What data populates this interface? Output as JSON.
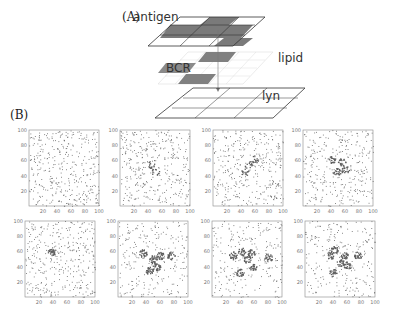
{
  "figure": {
    "part_a_label": "(A)",
    "part_b_label": "(B)",
    "layers": {
      "antigen": "antigen",
      "bcr": "BCR",
      "lipid": "lipid",
      "lyn": "lyn"
    },
    "colors": {
      "dark_cell": "#7a7a7a",
      "grid_line": "#444444",
      "lipid_grid": "#cccccc",
      "dot": "#6f6f6f",
      "frame": "#888888"
    }
  },
  "chart_data": [
    {
      "type": "scatter",
      "panel": 1,
      "row": 1,
      "xlim": [
        0,
        100
      ],
      "ylim": [
        0,
        100
      ],
      "x_ticks": [
        "20",
        "40",
        "60",
        "80",
        "100"
      ],
      "y_ticks": [
        "20",
        "40",
        "60",
        "80",
        "100"
      ],
      "clustering": "none",
      "clusters": []
    },
    {
      "type": "scatter",
      "panel": 2,
      "row": 1,
      "xlim": [
        0,
        100
      ],
      "ylim": [
        0,
        100
      ],
      "x_ticks": [
        "20",
        "40",
        "60",
        "80",
        "100"
      ],
      "y_ticks": [
        "20",
        "40",
        "60",
        "80",
        "100"
      ],
      "clustering": "faint",
      "clusters": [
        [
          45,
          55
        ],
        [
          50,
          45
        ]
      ]
    },
    {
      "type": "scatter",
      "panel": 3,
      "row": 1,
      "xlim": [
        0,
        100
      ],
      "ylim": [
        0,
        100
      ],
      "x_ticks": [
        "20",
        "40",
        "60",
        "80",
        "100"
      ],
      "y_ticks": [
        "20",
        "40",
        "60",
        "80",
        "100"
      ],
      "clustering": "weak",
      "clusters": [
        [
          50,
          55
        ],
        [
          45,
          45
        ],
        [
          60,
          62
        ]
      ]
    },
    {
      "type": "scatter",
      "panel": 4,
      "row": 1,
      "xlim": [
        0,
        100
      ],
      "ylim": [
        0,
        100
      ],
      "x_ticks": [
        "20",
        "40",
        "60",
        "80",
        "100"
      ],
      "y_ticks": [
        "20",
        "40",
        "60",
        "80",
        "100"
      ],
      "clustering": "moderate",
      "clusters": [
        [
          55,
          58
        ],
        [
          42,
          62
        ],
        [
          48,
          45
        ],
        [
          60,
          48
        ]
      ]
    },
    {
      "type": "scatter",
      "panel": 5,
      "row": 2,
      "xlim": [
        0,
        100
      ],
      "ylim": [
        0,
        100
      ],
      "x_ticks": [
        "20",
        "40",
        "60",
        "80",
        "100"
      ],
      "y_ticks": [
        "20",
        "40",
        "60",
        "80",
        "100"
      ],
      "clustering": "weak",
      "clusters": [
        [
          38,
          60
        ]
      ]
    },
    {
      "type": "scatter",
      "panel": 6,
      "row": 2,
      "xlim": [
        0,
        100
      ],
      "ylim": [
        0,
        100
      ],
      "x_ticks": [
        "20",
        "40",
        "60",
        "80",
        "100"
      ],
      "y_ticks": [
        "20",
        "40",
        "60",
        "80",
        "100"
      ],
      "clustering": "strong",
      "clusters": [
        [
          50,
          50
        ],
        [
          60,
          55
        ],
        [
          45,
          35
        ],
        [
          75,
          55
        ],
        [
          35,
          58
        ],
        [
          55,
          40
        ]
      ]
    },
    {
      "type": "scatter",
      "panel": 7,
      "row": 2,
      "xlim": [
        0,
        100
      ],
      "ylim": [
        0,
        100
      ],
      "x_ticks": [
        "20",
        "40",
        "60",
        "80",
        "100"
      ],
      "y_ticks": [
        "20",
        "40",
        "60",
        "80",
        "100"
      ],
      "clustering": "strong",
      "clusters": [
        [
          55,
          58
        ],
        [
          50,
          50
        ],
        [
          58,
          40
        ],
        [
          30,
          55
        ],
        [
          40,
          32
        ],
        [
          80,
          52
        ],
        [
          42,
          60
        ]
      ]
    },
    {
      "type": "scatter",
      "panel": 8,
      "row": 2,
      "xlim": [
        0,
        100
      ],
      "ylim": [
        0,
        100
      ],
      "x_ticks": [
        "20",
        "40",
        "60",
        "80",
        "100"
      ],
      "y_ticks": [
        "20",
        "40",
        "60",
        "80",
        "100"
      ],
      "clustering": "strong",
      "clusters": [
        [
          55,
          55
        ],
        [
          50,
          45
        ],
        [
          60,
          42
        ],
        [
          35,
          55
        ],
        [
          40,
          32
        ],
        [
          42,
          62
        ],
        [
          75,
          55
        ]
      ]
    }
  ]
}
